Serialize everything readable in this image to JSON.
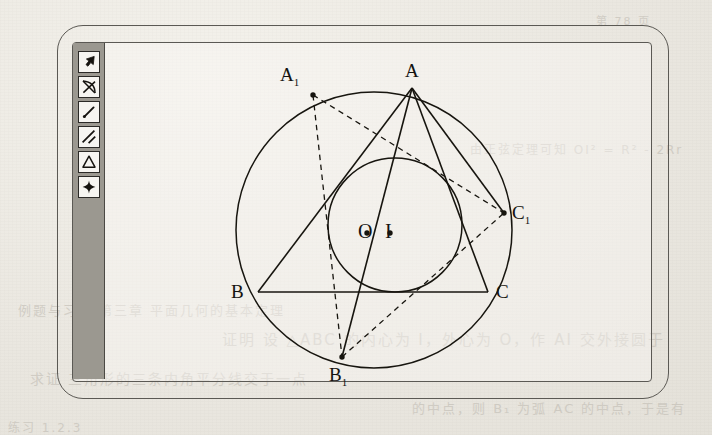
{
  "app": {
    "window_title": "",
    "frame_style": "rounded-double-border"
  },
  "toolbar": {
    "name": "drawing-tools",
    "orientation": "vertical",
    "background_color": "#9b9890",
    "tools": [
      {
        "id": "select",
        "icon": "arrow-cursor-icon",
        "label": "Select"
      },
      {
        "id": "circle-arc",
        "icon": "crossed-arc-icon",
        "label": "Arc / Circle"
      },
      {
        "id": "segment",
        "icon": "line-segment-icon",
        "label": "Segment"
      },
      {
        "id": "parallel",
        "icon": "parallel-lines-icon",
        "label": "Parallel"
      },
      {
        "id": "triangle",
        "icon": "triangle-icon",
        "label": "Polygon"
      },
      {
        "id": "point",
        "icon": "plus-point-icon",
        "label": "Point"
      }
    ]
  },
  "figure": {
    "caption": "Triangle ABC with circumcircle and incircle",
    "stroke_color": "#17150f",
    "fill": "none",
    "circles": [
      {
        "name": "circumcircle",
        "cx": 269,
        "cy": 187,
        "r": 138,
        "style": "solid"
      },
      {
        "name": "incircle",
        "cx": 290,
        "cy": 182,
        "r": 67,
        "style": "solid"
      }
    ],
    "points": [
      {
        "label": "A",
        "sub": "",
        "x": 307,
        "y": 45,
        "dot": false,
        "lx": 300,
        "ly": 18
      },
      {
        "label": "B",
        "sub": "",
        "x": 153,
        "y": 249,
        "dot": false,
        "lx": 126,
        "ly": 239
      },
      {
        "label": "C",
        "sub": "",
        "x": 383,
        "y": 249,
        "dot": false,
        "lx": 391,
        "ly": 239
      },
      {
        "label": "A",
        "sub": "1",
        "x": 208,
        "y": 52,
        "dot": true,
        "lx": 175,
        "ly": 22
      },
      {
        "label": "B",
        "sub": "1",
        "x": 237,
        "y": 314,
        "dot": true,
        "lx": 224,
        "ly": 322
      },
      {
        "label": "C",
        "sub": "1",
        "x": 399,
        "y": 170,
        "dot": true,
        "lx": 407,
        "ly": 160
      },
      {
        "label": "O",
        "sub": "",
        "x": 262,
        "y": 190,
        "dot": true,
        "lx": 253,
        "ly": 178
      },
      {
        "label": "I",
        "sub": "",
        "x": 285,
        "y": 190,
        "dot": true,
        "lx": 280,
        "ly": 178
      }
    ],
    "solid_segments": [
      {
        "from": "A",
        "to": "B"
      },
      {
        "from": "B",
        "to": "C"
      },
      {
        "from": "C",
        "to": "A"
      },
      {
        "from": "A",
        "to": "B1"
      },
      {
        "from": "A",
        "to": "C1"
      }
    ],
    "dashed_segments": [
      {
        "from": "A1",
        "to": "B1"
      },
      {
        "from": "A1",
        "to": "C1"
      },
      {
        "from": "B1",
        "to": "C1"
      }
    ]
  },
  "background_text": {
    "note": "faint bleed-through printing from reverse of scanned page",
    "lines": [
      {
        "text": "例题与习题 第三章 平面几何的基本定理",
        "x": 18,
        "y": 300,
        "size": 13
      },
      {
        "text": "证明 设 △ABC 的内心为 I，外心为 O，作 AI 交外接圆于",
        "x": 222,
        "y": 328,
        "size": 15
      },
      {
        "text": "求证 三角形的三条内角平分线交于一点",
        "x": 30,
        "y": 368,
        "size": 14
      },
      {
        "text": "的中点，则 B₁ 为弧 AC 的中点，于是有",
        "x": 412,
        "y": 398,
        "size": 13
      },
      {
        "text": "第 78 页",
        "x": 596,
        "y": 12,
        "size": 11
      },
      {
        "text": "由正弦定理可知 OI² = R² - 2Rr",
        "x": 470,
        "y": 140,
        "size": 12
      },
      {
        "text": "练习 1.2.3",
        "x": 8,
        "y": 418,
        "size": 12
      }
    ]
  }
}
